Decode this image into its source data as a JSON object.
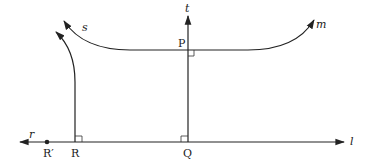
{
  "diagram": {
    "type": "geometry-figure",
    "lines": {
      "l": {
        "label": "l",
        "description": "horizontal line with arrows both ends"
      },
      "r": {
        "label": "r",
        "description": "left ray label of horizontal line"
      },
      "t": {
        "label": "t",
        "description": "vertical line through P and Q"
      },
      "m": {
        "label": "m",
        "description": "curve through P extending right"
      },
      "s": {
        "label": "s",
        "description": "curve through P extending left"
      }
    },
    "points": {
      "P": {
        "label": "P"
      },
      "Q": {
        "label": "Q"
      },
      "R": {
        "label": "R"
      },
      "R_prime": {
        "label": "R′"
      }
    },
    "right_angles": [
      "at P",
      "at Q",
      "at R"
    ],
    "colors": {
      "ink": "#222222",
      "background": "#ffffff"
    }
  }
}
